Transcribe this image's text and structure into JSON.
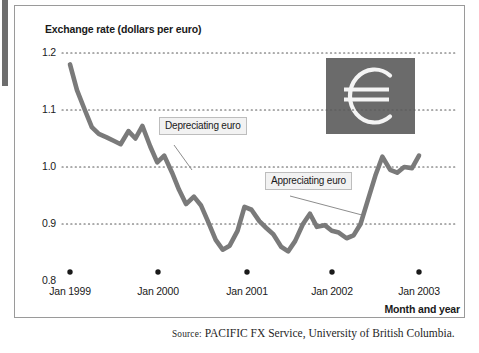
{
  "figure": {
    "y_axis_title": "Exchange rate (dollars per euro)",
    "x_axis_title": "Month and year",
    "source_prefix": "Source:",
    "source_text": " PACIFIC FX Service, University of British Columbia.",
    "logo_symbol": "€"
  },
  "annotations": [
    {
      "id": "depreciating",
      "label": "Depreciating euro"
    },
    {
      "id": "appreciating",
      "label": "Appreciating euro"
    }
  ],
  "chart_data": {
    "type": "line",
    "title": "",
    "subtitle": "",
    "xlabel": "Month and year",
    "ylabel": "Exchange rate (dollars per euro)",
    "ylim": [
      0.8,
      1.2
    ],
    "yticks": [
      "0.8",
      "0.9",
      "1.0",
      "1.1",
      "1.2"
    ],
    "ytick_values": [
      0.8,
      0.9,
      1.0,
      1.1,
      1.2
    ],
    "xticks": [
      "Jan 1999",
      "Jan 2000",
      "Jan 2001",
      "Jan 2002",
      "Jan 2003"
    ],
    "xtick_values": [
      1999.0,
      2000.0,
      2001.0,
      2002.0,
      2003.0
    ],
    "xlim": [
      1999.0,
      2003.05
    ],
    "grid": "horizontal-dotted",
    "legend": "none",
    "line_color": "#7a7a7a",
    "series": [
      {
        "name": "Dollars per euro",
        "x": [
          1999.0,
          1999.08,
          1999.17,
          1999.25,
          1999.33,
          1999.42,
          1999.5,
          1999.58,
          1999.67,
          1999.75,
          1999.83,
          1999.92,
          2000.0,
          2000.08,
          2000.17,
          2000.25,
          2000.33,
          2000.42,
          2000.5,
          2000.58,
          2000.67,
          2000.75,
          2000.83,
          2000.92,
          2001.0,
          2001.08,
          2001.17,
          2001.25,
          2001.33,
          2001.42,
          2001.5,
          2001.58,
          2001.67,
          2001.75,
          2001.83,
          2001.92,
          2002.0,
          2002.08,
          2002.17,
          2002.25,
          2002.33,
          2002.42,
          2002.5,
          2002.58,
          2002.67,
          2002.75,
          2002.83,
          2002.92,
          2003.0
        ],
        "y": [
          1.18,
          1.135,
          1.1,
          1.07,
          1.058,
          1.052,
          1.046,
          1.04,
          1.063,
          1.05,
          1.072,
          1.036,
          1.008,
          1.02,
          0.99,
          0.96,
          0.935,
          0.948,
          0.933,
          0.905,
          0.872,
          0.855,
          0.862,
          0.888,
          0.93,
          0.925,
          0.905,
          0.893,
          0.882,
          0.86,
          0.852,
          0.87,
          0.9,
          0.918,
          0.895,
          0.898,
          0.888,
          0.885,
          0.875,
          0.88,
          0.9,
          0.945,
          0.985,
          1.018,
          0.995,
          0.99,
          1.0,
          0.998,
          1.02
        ]
      }
    ]
  }
}
